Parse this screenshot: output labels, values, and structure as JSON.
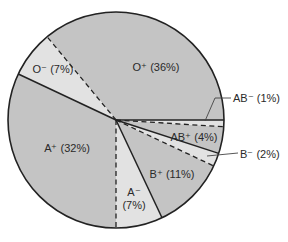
{
  "chart_data": {
    "type": "pie",
    "title": "",
    "center": [
      116,
      120
    ],
    "radius": 108,
    "start_angle_deg": 0,
    "direction": "counterclockwise",
    "slices": [
      {
        "label": "O⁺ (36%)",
        "name": "O+",
        "value": 36,
        "fill": "#c4c4c4",
        "boundary_end": "dashed"
      },
      {
        "label": "O⁻ (7%)",
        "name": "O-",
        "value": 7,
        "fill": "#e2e2e2",
        "boundary_end": "solid"
      },
      {
        "label": "A⁺ (32%)",
        "name": "A+",
        "value": 32,
        "fill": "#c4c4c4",
        "boundary_end": "dashed"
      },
      {
        "label": "A⁻ (7%)",
        "name": "A-",
        "value": 7,
        "fill": "#e2e2e2",
        "boundary_end": "solid"
      },
      {
        "label": "B⁺ (11%)",
        "name": "B+",
        "value": 11,
        "fill": "#c4c4c4",
        "boundary_end": "dashed"
      },
      {
        "label": "B⁻ (2%)",
        "name": "B-",
        "value": 2,
        "fill": "#e2e2e2",
        "boundary_end": "solid"
      },
      {
        "label": "AB⁺ (4%)",
        "name": "AB+",
        "value": 4,
        "fill": "#c4c4c4",
        "boundary_end": "dashed"
      },
      {
        "label": "AB⁻ (1%)",
        "name": "AB-",
        "value": 1,
        "fill": "#e2e2e2",
        "boundary_end": "solid"
      }
    ],
    "labels": {
      "O+": {
        "x": 156,
        "y": 71,
        "anchor": "middle",
        "lines": [
          "O⁺ (36%)"
        ]
      },
      "O-": {
        "x": 53,
        "y": 73,
        "anchor": "middle",
        "lines": [
          "O⁻ (7%)"
        ]
      },
      "A+": {
        "x": 67,
        "y": 152,
        "anchor": "middle",
        "lines": [
          "A⁺ (32%)"
        ]
      },
      "A-": {
        "x": 134,
        "y": 196,
        "anchor": "middle",
        "lines": [
          "A⁻",
          "(7%)"
        ]
      },
      "B+": {
        "x": 172,
        "y": 178,
        "anchor": "middle",
        "lines": [
          "B⁺ (11%)"
        ]
      },
      "AB+": {
        "x": 194,
        "y": 141,
        "anchor": "middle",
        "lines": [
          "AB⁺ (4%)"
        ]
      },
      "AB-": {
        "x": 233,
        "y": 102,
        "anchor": "start",
        "lines": [
          "AB⁻ (1%)"
        ],
        "leader": [
          [
            205,
            121
          ],
          [
            215,
            98
          ],
          [
            231,
            98
          ]
        ]
      },
      "B-": {
        "x": 240,
        "y": 158,
        "anchor": "start",
        "lines": [
          "B⁻ (2%)"
        ],
        "leader": [
          [
            207,
            156
          ],
          [
            238,
            153
          ]
        ]
      }
    },
    "legend": null,
    "grid": false
  },
  "colors": {
    "dark_fill": "#c4c4c4",
    "light_fill": "#e2e2e2",
    "stroke": "#222222",
    "text": "#2a2a2a"
  }
}
